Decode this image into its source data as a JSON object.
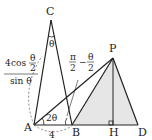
{
  "points": {
    "A": "A",
    "B": "B",
    "C": "C",
    "D": "D",
    "H": "H",
    "P": "P"
  },
  "labels": {
    "ac_length_num_coef": "4",
    "ac_length_num_fn": "cos",
    "ac_length_num_arg_top": "θ",
    "ac_length_num_arg_bot": "2",
    "ac_length_den": "sin θ",
    "angle_c": "θ",
    "angle_a": "2θ",
    "angle_b_top_left": "π",
    "angle_b_bot_left": "2",
    "angle_b_minus": "−",
    "angle_b_top_right": "θ",
    "angle_b_bot_right": "2",
    "ab_length": "4"
  },
  "colors": {
    "line": "#222222",
    "fill": "#e6e6e6",
    "dashed": "#666666"
  }
}
